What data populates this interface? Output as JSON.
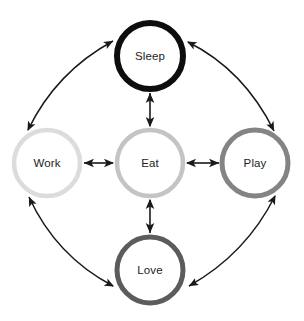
{
  "diagram": {
    "type": "node-link-diagram",
    "background_color": "#ffffff",
    "arrow_color": "#1a1a1a",
    "label_color": "#1c1c1c",
    "nodes": [
      {
        "id": "sleep",
        "label": "Sleep",
        "cx": 150,
        "cy": 56,
        "r": 33,
        "stroke_width": 6,
        "stroke_color": "#0d0d0d",
        "fill": "#ffffff",
        "position": "top"
      },
      {
        "id": "work",
        "label": "Work",
        "cx": 47,
        "cy": 163,
        "r": 33,
        "stroke_width": 4.5,
        "stroke_color": "#dcdcdc",
        "fill": "#ffffff",
        "position": "left"
      },
      {
        "id": "eat",
        "label": "Eat",
        "cx": 150,
        "cy": 163,
        "r": 33,
        "stroke_width": 4.5,
        "stroke_color": "#c4c4c4",
        "fill": "#ffffff",
        "position": "center"
      },
      {
        "id": "play",
        "label": "Play",
        "cx": 255,
        "cy": 163,
        "r": 33,
        "stroke_width": 5,
        "stroke_color": "#848484",
        "fill": "#ffffff",
        "position": "right"
      },
      {
        "id": "love",
        "label": "Love",
        "cx": 150,
        "cy": 270,
        "r": 33,
        "stroke_width": 5,
        "stroke_color": "#5c5c5c",
        "fill": "#ffffff",
        "position": "bottom"
      }
    ],
    "edges": [
      {
        "id": "eat-sleep",
        "from": "eat",
        "to": "sleep",
        "style": "straight",
        "bidirectional": true
      },
      {
        "id": "eat-work",
        "from": "eat",
        "to": "work",
        "style": "straight",
        "bidirectional": true
      },
      {
        "id": "eat-play",
        "from": "eat",
        "to": "play",
        "style": "straight",
        "bidirectional": true
      },
      {
        "id": "eat-love",
        "from": "eat",
        "to": "love",
        "style": "straight",
        "bidirectional": true
      },
      {
        "id": "work-sleep",
        "from": "work",
        "to": "sleep",
        "style": "curved",
        "bidirectional": true
      },
      {
        "id": "sleep-play",
        "from": "sleep",
        "to": "play",
        "style": "curved",
        "bidirectional": true
      },
      {
        "id": "play-love",
        "from": "play",
        "to": "love",
        "style": "curved",
        "bidirectional": true
      },
      {
        "id": "love-work",
        "from": "love",
        "to": "work",
        "style": "curved",
        "bidirectional": true
      }
    ]
  }
}
